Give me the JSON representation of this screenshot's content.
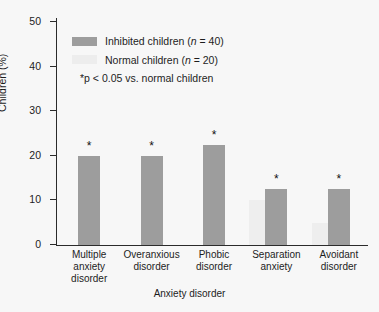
{
  "chart_data": {
    "type": "bar",
    "title": "",
    "xlabel": "Anxiety disorder",
    "ylabel": "Children (%)",
    "ylim": [
      0,
      50
    ],
    "yticks": [
      0,
      10,
      20,
      30,
      40,
      50
    ],
    "grid": false,
    "legend_position": "top-left",
    "categories": [
      "Multiple\nanxiety\ndisorder",
      "Overanxious\ndisorder",
      "Phobic\ndisorder",
      "Separation\nanxiety",
      "Avoidant\ndisorder"
    ],
    "series": [
      {
        "name": "Inhibited children (n = 40)",
        "color": "#9d9d9d",
        "values": [
          20,
          20,
          22.5,
          12.5,
          12.5
        ]
      },
      {
        "name": "Normal children (n = 20)",
        "color": "#ededed",
        "values": [
          0,
          0,
          0,
          10,
          5
        ]
      }
    ],
    "annotations": {
      "significance_marker": "*",
      "significant_categories": [
        "Multiple anxiety disorder",
        "Overanxious disorder",
        "Phobic disorder",
        "Separation anxiety",
        "Avoidant disorder"
      ],
      "footnote": "*p < 0.05 vs. normal children"
    }
  },
  "legend": {
    "items": [
      {
        "label_prefix": "Inhibited children (",
        "label_italic": "n",
        "label_suffix": " = 40)",
        "swatch": "inhibited"
      },
      {
        "label_prefix": "Normal children (",
        "label_italic": "n",
        "label_suffix": " = 20)",
        "swatch": "normal"
      }
    ],
    "pvalue_note": "*p < 0.05 vs. normal children"
  },
  "axes": {
    "y_ticks": [
      "50",
      "40",
      "30",
      "20",
      "10",
      "0"
    ],
    "y_title": "Children (%)",
    "x_title": "Anxiety disorder",
    "x_ticks": [
      "Multiple\nanxiety\ndisorder",
      "Overanxious\ndisorder",
      "Phobic\ndisorder",
      "Separation\nanxiety",
      "Avoidant\ndisorder"
    ]
  },
  "bars": [
    {
      "name": "multiple-anxiety-disorder",
      "inhibited": 20,
      "normal": 0,
      "star": "*"
    },
    {
      "name": "overanxious-disorder",
      "inhibited": 20,
      "normal": 0,
      "star": "*"
    },
    {
      "name": "phobic-disorder",
      "inhibited": 22.5,
      "normal": 0,
      "star": "*"
    },
    {
      "name": "separation-anxiety",
      "inhibited": 12.5,
      "normal": 10,
      "star": "*"
    },
    {
      "name": "avoidant-disorder",
      "inhibited": 12.5,
      "normal": 5,
      "star": "*"
    }
  ],
  "colors": {
    "inhibited": "#9d9d9d",
    "normal": "#ededed",
    "axis": "#2b2b2b",
    "background": "#f7f7f7"
  }
}
